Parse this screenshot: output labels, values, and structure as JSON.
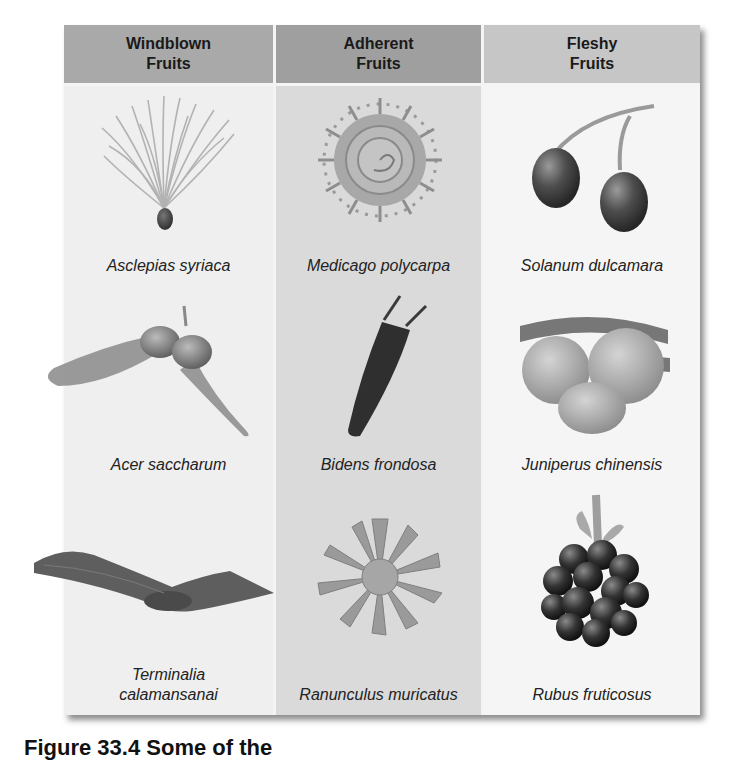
{
  "figure": {
    "columns": [
      {
        "header_line1": "Windblown",
        "header_line2": "Fruits",
        "items": [
          {
            "species": "Asclepias syriaca",
            "icon": "milkweed-seed-icon"
          },
          {
            "species": "Acer saccharum",
            "icon": "maple-samara-icon"
          },
          {
            "species": "Terminalia calamansanai",
            "species_line1": "Terminalia",
            "species_line2": "calamansanai",
            "icon": "winged-fruit-icon"
          }
        ]
      },
      {
        "header_line1": "Adherent",
        "header_line2": "Fruits",
        "items": [
          {
            "species": "Medicago polycarpa",
            "icon": "spiral-burr-icon"
          },
          {
            "species": "Bidens frondosa",
            "icon": "barbed-achene-icon"
          },
          {
            "species": "Ranunculus muricatus",
            "icon": "spiny-achene-cluster-icon"
          }
        ]
      },
      {
        "header_line1": "Fleshy",
        "header_line2": "Fruits",
        "items": [
          {
            "species": "Solanum dulcamara",
            "icon": "berry-pair-icon"
          },
          {
            "species": "Juniperus chinensis",
            "icon": "juniper-cone-icon"
          },
          {
            "species": "Rubus fruticosus",
            "icon": "blackberry-icon"
          }
        ]
      }
    ]
  },
  "caption": {
    "text": "Figure 33.4  Some of the"
  },
  "colors": {
    "header_windblown": "#a9a9a9",
    "header_adherent": "#9f9f9f",
    "header_fleshy": "#c6c6c6",
    "body_windblown": "#efefef",
    "body_adherent": "#dadada",
    "body_fleshy": "#f5f5f5"
  }
}
